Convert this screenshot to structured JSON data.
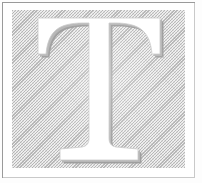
{
  "artwork": {
    "kind": "decorative-initial",
    "letter": "T",
    "caption": "T",
    "description": "Decorative drop-cap initial letter T, white serif letterform with grey drop shadow on a hatched grey panel within a thin ruled frame",
    "style": "knockout serif capital with bracketed slab serifs and drop shadow",
    "medium": "scanned letterpress print"
  },
  "frame": {
    "rule_label": "page-rule",
    "rule_color": "#9a9a9a",
    "rule_width_px": 1,
    "margin_color": "#ffffff"
  },
  "panel": {
    "label": "hatched-ground-panel",
    "fill_color": "#eeeeee",
    "hatch_color": "#969696",
    "hatch_angle_deg": 135,
    "width_px": 173,
    "height_px": 158
  },
  "letterform": {
    "glyph": "T",
    "face_color": "#ffffff",
    "shadow_color": "#9b9b9b",
    "shadow_offset_x_px": 3,
    "shadow_offset_y_px": 3,
    "outline_color": "#bdbdbd"
  },
  "canvas": {
    "width_px": 202,
    "height_px": 183,
    "background_color": "#ffffff"
  }
}
